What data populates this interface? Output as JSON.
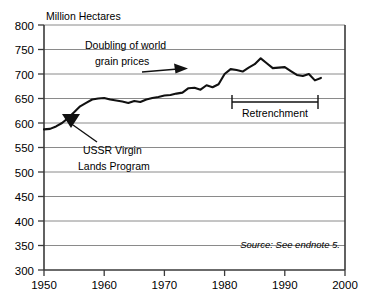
{
  "chart_data": {
    "type": "line",
    "title": "",
    "subtitle": "",
    "ylabel": "Million Hectares",
    "xlabel": "",
    "ylim": [
      300,
      800
    ],
    "xlim": [
      1950,
      2000
    ],
    "grid": true,
    "legend_position": "none",
    "y_ticks": [
      300,
      350,
      400,
      450,
      500,
      550,
      600,
      650,
      700,
      750,
      800
    ],
    "x_ticks": [
      1950,
      1960,
      1970,
      1980,
      1990,
      2000
    ],
    "source_note": "Source: See endnote 5.",
    "series": [
      {
        "name": "World Grainland Area",
        "x": [
          1950,
          1951,
          1952,
          1953,
          1954,
          1955,
          1956,
          1957,
          1958,
          1959,
          1960,
          1961,
          1962,
          1963,
          1964,
          1965,
          1966,
          1967,
          1968,
          1969,
          1970,
          1971,
          1972,
          1973,
          1974,
          1975,
          1976,
          1977,
          1978,
          1979,
          1980,
          1981,
          1982,
          1983,
          1984,
          1985,
          1986,
          1987,
          1988,
          1989,
          1990,
          1991,
          1992,
          1993,
          1994,
          1995,
          1996
        ],
        "values": [
          587,
          588,
          593,
          600,
          610,
          622,
          634,
          641,
          648,
          650,
          651,
          648,
          646,
          644,
          641,
          645,
          643,
          648,
          651,
          653,
          656,
          657,
          660,
          662,
          671,
          672,
          668,
          677,
          673,
          679,
          700,
          710,
          708,
          705,
          713,
          720,
          732,
          722,
          712,
          713,
          714,
          706,
          698,
          696,
          700,
          687,
          692
        ]
      }
    ],
    "annotations": [
      {
        "name": "doubling-of-world-grain-prices",
        "line1": "Doubling of world",
        "line2": "grain prices",
        "arrow": "points-right-to-1974"
      },
      {
        "name": "ussr-virgin-lands-program",
        "line1": "USSR Virgin",
        "line2": "Lands Program",
        "arrow": "points-up-left-to-1956"
      },
      {
        "name": "retrenchment",
        "label": "Retrenchment",
        "bracket_start_year": 1981,
        "bracket_end_year": 1996
      }
    ],
    "colors": {
      "line": "#111111",
      "grid": "#8a8a8a",
      "axis": "#3a3a3a",
      "background": "#ffffff"
    }
  }
}
